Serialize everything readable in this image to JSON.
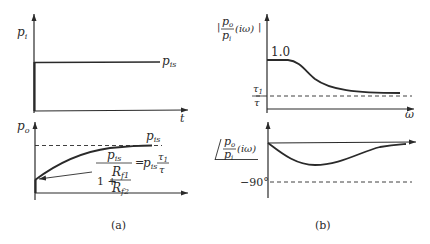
{
  "panel_a": {
    "caption": "(a)",
    "input_plot": {
      "ylabel": "p",
      "ylabel_sub": "i",
      "xlabel": "t",
      "step_label": "p",
      "step_label_sub": "is"
    },
    "output_plot": {
      "ylabel": "p",
      "ylabel_sub": "o",
      "asymptote_label": "p",
      "asymptote_label_sub": "is",
      "initial_value_expression": {
        "numerator": "p",
        "numerator_sub": "is",
        "denominator_prefix": "1 + ",
        "ratio_numerator": "R",
        "ratio_numerator_sub": "f1",
        "ratio_denominator": "R",
        "ratio_denominator_sub": "f2",
        "equals": "=",
        "rhs": "p",
        "rhs_sub": "is",
        "rhs_frac_num": "τ",
        "rhs_frac_num_sub": "1",
        "rhs_frac_den": "τ"
      }
    }
  },
  "panel_b": {
    "caption": "(b)",
    "magnitude_plot": {
      "ylabel_num": "p",
      "ylabel_num_sub": "o",
      "ylabel_den": "p",
      "ylabel_den_sub": "i",
      "ylabel_arg": "(iω)",
      "bars": "|",
      "high_freq_value": "1.0",
      "asymptote_num": "τ",
      "asymptote_num_sub": "1",
      "asymptote_den": "τ",
      "xlabel": "ω"
    },
    "phase_plot": {
      "angle_symbol": "∠",
      "ylabel_num": "p",
      "ylabel_num_sub": "o",
      "ylabel_den": "p",
      "ylabel_den_sub": "i",
      "ylabel_arg": "(iω)",
      "limit_label": "−90°"
    }
  },
  "colors": {
    "ink": "#2a2a2a",
    "background": "#ffffff"
  }
}
